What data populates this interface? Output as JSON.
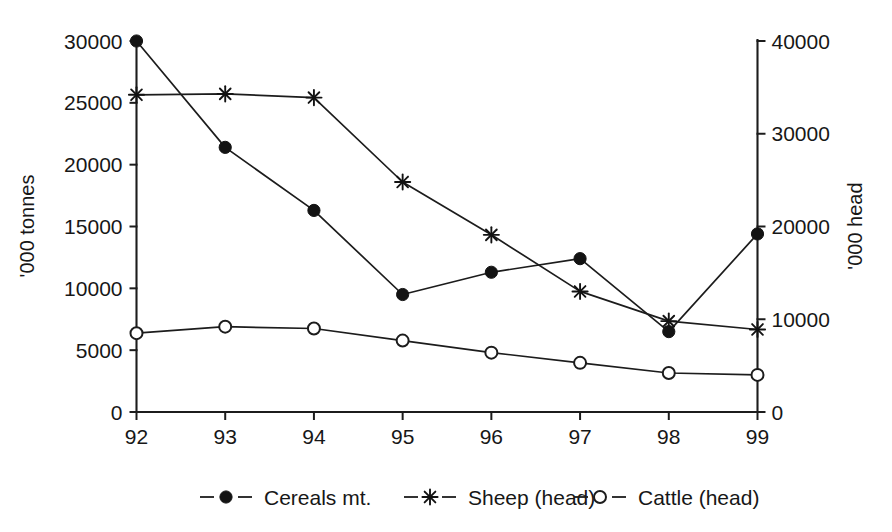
{
  "chart_data": {
    "type": "line",
    "title": "",
    "subtitle": "",
    "xlabel": "",
    "ylabel": "'000 tonnes",
    "y2label": "'000 head",
    "grid": false,
    "legend_position": "bottom",
    "categories": [
      "92",
      "93",
      "94",
      "95",
      "96",
      "97",
      "98",
      "99"
    ],
    "xlim": [
      0,
      7
    ],
    "ylim": [
      0,
      30000
    ],
    "y2lim": [
      0,
      40000
    ],
    "yticks": [
      0,
      5000,
      10000,
      15000,
      20000,
      25000,
      30000
    ],
    "ytick_labels": [
      "0",
      "5000",
      "10000",
      "15000",
      "20000",
      "25000",
      "30000"
    ],
    "y2ticks": [
      0,
      10000,
      20000,
      30000,
      40000
    ],
    "y2tick_labels": [
      "0",
      "10000",
      "20000",
      "30000",
      "40000"
    ],
    "series": [
      {
        "name": "Cereals mt.",
        "axis": "left",
        "marker": "filled-circle",
        "values": [
          30000,
          21400,
          16300,
          9500,
          11300,
          12400,
          6500,
          14400
        ]
      },
      {
        "name": "Sheep (head)",
        "axis": "right",
        "marker": "asterisk",
        "values": [
          34200,
          34300,
          33900,
          24800,
          19100,
          13000,
          9800,
          8900
        ]
      },
      {
        "name": "Cattle (head)",
        "axis": "right",
        "marker": "open-circle",
        "values": [
          8500,
          9200,
          9000,
          7700,
          6400,
          5300,
          4200,
          4000
        ]
      }
    ]
  },
  "axes": {
    "left_title": "'000 tonnes",
    "right_title": "'000 head",
    "left_ticks": [
      "30000",
      "25000",
      "20000",
      "15000",
      "10000",
      "5000",
      "0"
    ],
    "right_ticks": [
      "40000",
      "30000",
      "20000",
      "10000",
      "0"
    ],
    "x_ticks": [
      "92",
      "93",
      "94",
      "95",
      "96",
      "97",
      "98",
      "99"
    ]
  },
  "legend": {
    "items": [
      {
        "label": "Cereals mt.",
        "marker": "filled-circle"
      },
      {
        "label": "Sheep (head)",
        "marker": "asterisk"
      },
      {
        "label": "Cattle (head)",
        "marker": "open-circle"
      }
    ]
  },
  "colors": {
    "ink": "#1c1c1c",
    "background": "#ffffff"
  }
}
